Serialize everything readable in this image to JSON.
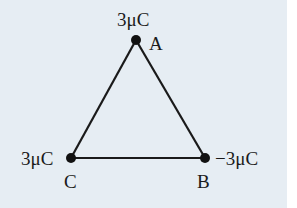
{
  "diagram": {
    "type": "charge-triangle",
    "background_color": "#e6edf3",
    "line_color": "#1a1a1a",
    "vertices": [
      {
        "id": "A",
        "label": "A",
        "charge": "3μC",
        "x": 136,
        "y": 40
      },
      {
        "id": "B",
        "label": "B",
        "charge": "−3μC",
        "x": 205,
        "y": 158
      },
      {
        "id": "C",
        "label": "C",
        "charge": "3μC",
        "x": 71,
        "y": 158
      }
    ],
    "edges": [
      [
        "A",
        "B"
      ],
      [
        "B",
        "C"
      ],
      [
        "C",
        "A"
      ]
    ]
  }
}
